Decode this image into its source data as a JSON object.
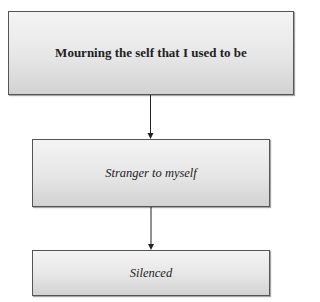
{
  "diagram": {
    "type": "vertical-flowchart",
    "nodes": [
      {
        "id": "n1",
        "label": "Mourning the self that I used to be",
        "style": "bold"
      },
      {
        "id": "n2",
        "label": "Stranger to myself",
        "style": "italic"
      },
      {
        "id": "n3",
        "label": "Silenced",
        "style": "italic"
      }
    ],
    "edges": [
      {
        "from": "n1",
        "to": "n2"
      },
      {
        "from": "n2",
        "to": "n3"
      }
    ],
    "colors": {
      "border": "#555555",
      "fill_top": "#f4f4f4",
      "fill_bottom": "#d2d2d2",
      "arrow": "#222222",
      "text": "#222222"
    }
  }
}
